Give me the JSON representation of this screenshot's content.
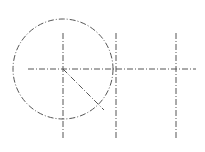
{
  "diagram": {
    "type": "technical-drawing",
    "background": "#ffffff",
    "stroke_color": "#555555",
    "center_dash": "6 2 1 2",
    "circle": {
      "cx": 63,
      "cy": 69,
      "r": 50
    },
    "horizontal_centerline": {
      "x1": 28,
      "y1": 69,
      "x2": 196,
      "y2": 69
    },
    "vertical_centerlines": [
      {
        "x1": 63,
        "y1": 33,
        "x2": 63,
        "y2": 139
      },
      {
        "x1": 116,
        "y1": 33,
        "x2": 116,
        "y2": 139
      },
      {
        "x1": 176,
        "y1": 33,
        "x2": 176,
        "y2": 139
      }
    ],
    "radius_line": {
      "x1": 63,
      "y1": 69,
      "x2": 104,
      "y2": 110
    }
  }
}
